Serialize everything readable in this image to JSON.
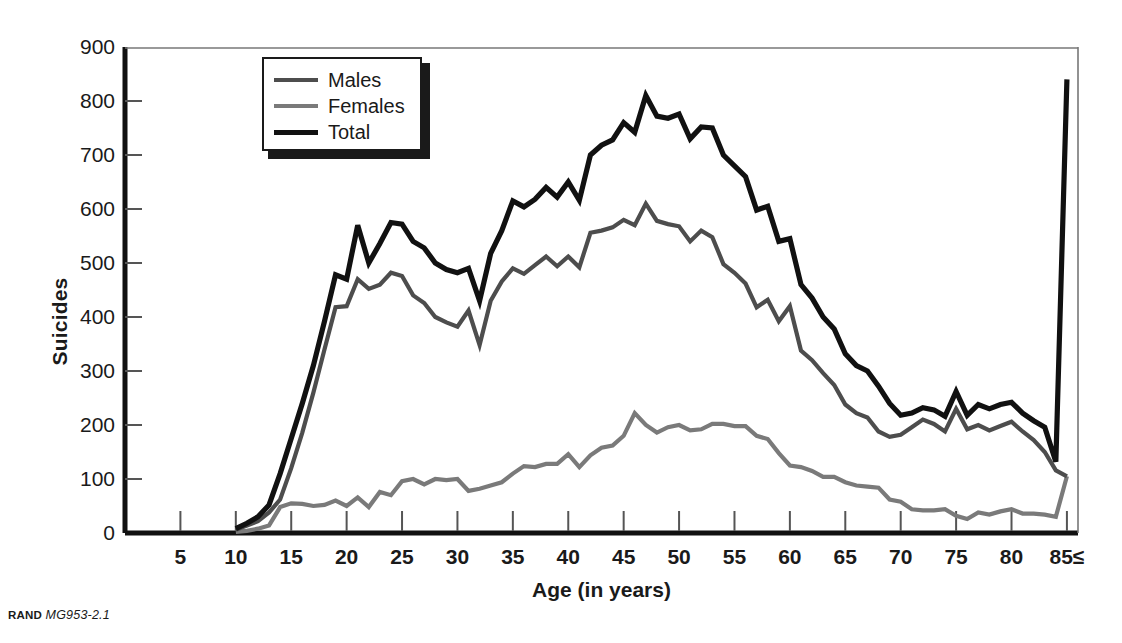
{
  "figure": {
    "footer_label": "RAND",
    "footer_code": "MG953-2.1"
  },
  "legend": {
    "entries": [
      {
        "label": "Males",
        "color": "#4d4d4d",
        "width": 4
      },
      {
        "label": "Females",
        "color": "#7a7a7a",
        "width": 4
      },
      {
        "label": "Total",
        "color": "#111111",
        "width": 5
      }
    ]
  },
  "chart_data": {
    "type": "line",
    "title": "",
    "xlabel": "Age (in years)",
    "ylabel": "Suicides",
    "xlim": [
      0,
      86
    ],
    "ylim": [
      0,
      900
    ],
    "ytick_labels": [
      "0",
      "100",
      "200",
      "300",
      "400",
      "500",
      "600",
      "700",
      "800",
      "900"
    ],
    "yticks": [
      0,
      100,
      200,
      300,
      400,
      500,
      600,
      700,
      800,
      900
    ],
    "xtick_labels": [
      "5",
      "10",
      "15",
      "20",
      "25",
      "30",
      "35",
      "40",
      "45",
      "50",
      "55",
      "60",
      "65",
      "70",
      "75",
      "80",
      "85≤"
    ],
    "xticks": [
      5,
      10,
      15,
      20,
      25,
      30,
      35,
      40,
      45,
      50,
      55,
      60,
      65,
      70,
      75,
      80,
      85
    ],
    "grid": false,
    "legend_position": "upper-left-inside",
    "x": [
      10,
      11,
      12,
      13,
      14,
      15,
      16,
      17,
      18,
      19,
      20,
      21,
      22,
      23,
      24,
      25,
      26,
      27,
      28,
      29,
      30,
      31,
      32,
      33,
      34,
      35,
      36,
      37,
      38,
      39,
      40,
      41,
      42,
      43,
      44,
      45,
      46,
      47,
      48,
      49,
      50,
      51,
      52,
      53,
      54,
      55,
      56,
      57,
      58,
      59,
      60,
      61,
      62,
      63,
      64,
      65,
      66,
      67,
      68,
      69,
      70,
      71,
      72,
      73,
      74,
      75,
      76,
      77,
      78,
      79,
      80,
      81,
      82,
      83,
      84,
      85
    ],
    "series": [
      {
        "name": "Total",
        "color": "#111111",
        "values": [
          8,
          18,
          30,
          52,
          110,
          175,
          240,
          310,
          392,
          478,
          470,
          570,
          500,
          536,
          575,
          572,
          540,
          528,
          500,
          488,
          482,
          490,
          430,
          518,
          560,
          615,
          604,
          618,
          640,
          622,
          650,
          616,
          700,
          718,
          728,
          760,
          742,
          810,
          772,
          768,
          776,
          730,
          752,
          750,
          700,
          680,
          660,
          598,
          605,
          540,
          545,
          460,
          435,
          400,
          378,
          332,
          310,
          300,
          272,
          240,
          218,
          222,
          232,
          228,
          216,
          262,
          218,
          238,
          230,
          238,
          242,
          222,
          208,
          196,
          132,
          840
        ]
      },
      {
        "name": "Males",
        "color": "#4d4d4d",
        "values": [
          6,
          14,
          22,
          38,
          62,
          120,
          186,
          260,
          340,
          418,
          420,
          470,
          452,
          460,
          482,
          476,
          440,
          426,
          400,
          390,
          382,
          412,
          348,
          430,
          466,
          490,
          480,
          496,
          512,
          494,
          512,
          492,
          556,
          560,
          566,
          580,
          570,
          610,
          578,
          572,
          568,
          540,
          560,
          548,
          498,
          482,
          462,
          418,
          432,
          392,
          420,
          338,
          320,
          296,
          274,
          238,
          222,
          214,
          188,
          178,
          182,
          196,
          210,
          202,
          188,
          230,
          192,
          200,
          190,
          198,
          206,
          188,
          172,
          150,
          116,
          105
        ]
      },
      {
        "name": "Females",
        "color": "#7a7a7a",
        "values": [
          2,
          4,
          8,
          14,
          48,
          55,
          54,
          50,
          52,
          60,
          50,
          66,
          48,
          76,
          70,
          96,
          100,
          90,
          100,
          98,
          100,
          78,
          82,
          88,
          94,
          110,
          124,
          122,
          128,
          128,
          146,
          122,
          144,
          158,
          162,
          180,
          222,
          200,
          186,
          196,
          200,
          190,
          192,
          202,
          202,
          198,
          198,
          180,
          174,
          148,
          125,
          122,
          115,
          104,
          104,
          94,
          88,
          86,
          84,
          62,
          58,
          44,
          42,
          42,
          44,
          32,
          26,
          38,
          34,
          40,
          44,
          36,
          36,
          34,
          30,
          105
        ]
      }
    ]
  }
}
